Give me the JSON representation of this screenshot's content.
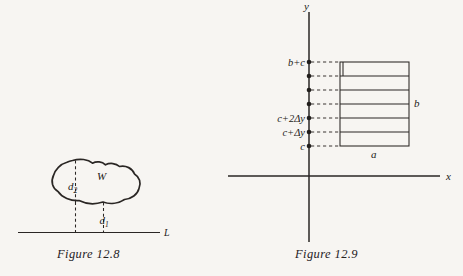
{
  "figures": [
    {
      "id": "figure-12-8",
      "caption": "Figure 12.8",
      "region_label": "W",
      "distance_upper": "d",
      "distance_upper_sub": "2",
      "distance_lower": "d",
      "distance_lower_sub": "1",
      "line_label": "L"
    },
    {
      "id": "figure-12-9",
      "caption": "Figure 12.9",
      "axis_x_label": "x",
      "axis_y_label": "y",
      "width_label": "a",
      "height_label": "b",
      "tick_labels": [
        "c",
        "c+Δy",
        "c+2Δy",
        "",
        "",
        "",
        "b+c"
      ],
      "strip_count": 6
    }
  ],
  "colors": {
    "background": "#f7f5f2",
    "ink": "#2a2624",
    "ink_soft": "#3a3533"
  }
}
